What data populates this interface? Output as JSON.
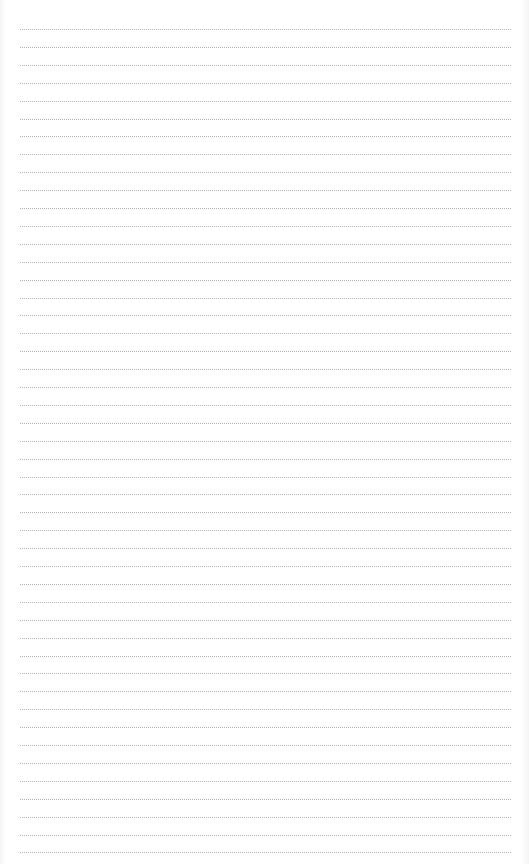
{
  "page": {
    "type": "blank-lined-page",
    "line_style": "dotted",
    "line_color": "#b5b5b5",
    "background_color": "#ffffff",
    "line_count": 47,
    "line_spacing_px": 17.9,
    "first_line_y": 29,
    "line_left_x": 20,
    "line_right_x": 511
  }
}
